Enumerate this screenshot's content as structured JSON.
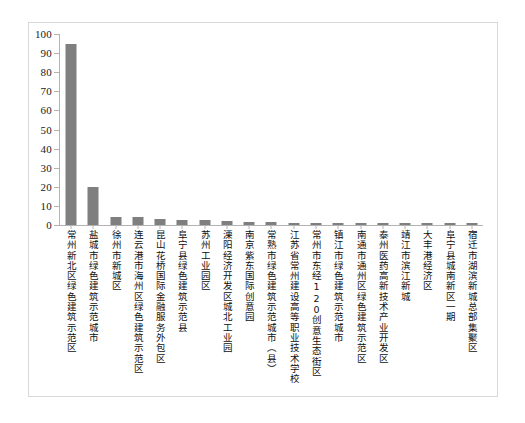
{
  "chart_data": {
    "type": "bar",
    "title": "",
    "subtitle": "",
    "xlabel": "",
    "ylabel": "",
    "ylim": [
      0,
      100
    ],
    "yticks": [
      0,
      10,
      20,
      30,
      40,
      50,
      60,
      70,
      80,
      90,
      100
    ],
    "grid": false,
    "legend": "none",
    "bar_color": "#7f7f7f",
    "axis_color": "#b3b3b3",
    "categories": [
      "常州新北区绿色建筑示范区",
      "盐城市绿色建筑示范城市",
      "徐州市新城区",
      "连云港市海州区绿色建筑示范区",
      "昆山花桥国际金融服务外包区",
      "阜宁县绿色建筑示范县",
      "苏州工业园区",
      "溧阳经济开发区城北工业园",
      "南京紫东国际创意园",
      "常熟市绿色建筑示范城市（县）",
      "江苏省常州建设高等职业技术学校",
      "常州市东经120创意生态街区",
      "镇江市绿色建筑示范城市",
      "南通市通州区绿色建筑示范区",
      "泰州医药高新技术产业开发区",
      "靖江市滨江新城",
      "大丰港经济区",
      "阜宁县城南新区一期",
      "宿迁市湖滨新城总部集聚区"
    ],
    "values": [
      94.8,
      19.8,
      4.4,
      4.0,
      3.2,
      2.6,
      2.4,
      2.0,
      1.6,
      1.4,
      1.3,
      1.2,
      1.1,
      1.1,
      1.0,
      1.0,
      0.9,
      0.9,
      0.8
    ]
  }
}
